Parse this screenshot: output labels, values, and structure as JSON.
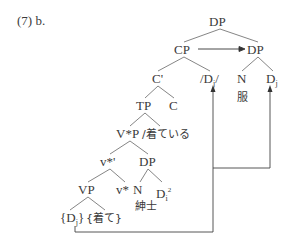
{
  "example_label": "(7) b.",
  "tree": {
    "root": "DP",
    "cp": "CP",
    "dp_right": "DP",
    "c_bar": "C'",
    "d_slash": "/D",
    "d_slash_sub": "j",
    "d_slash_end": "/",
    "n_right": "N",
    "d_right": "D",
    "d_right_sub": "j",
    "fuku": "服",
    "tp": "TP",
    "c": "C",
    "vstar_p": "V*P",
    "kiteiru": "/着ている",
    "vstar_bar": "v*'",
    "dp_lower": "DP",
    "vp": "VP",
    "vstar": "v*",
    "n_lower": "N",
    "d_lower": "D",
    "d_lower_sub": "i",
    "d_lower_sup": "2",
    "shinshi": "紳士",
    "dj_brace_open": "{D",
    "dj_brace_sub": "j",
    "dj_brace_close": "}",
    "kite": "{着て}"
  }
}
